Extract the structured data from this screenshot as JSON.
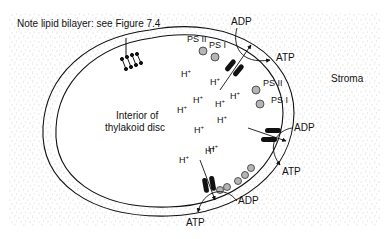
{
  "title_note": "Note lipid bilayer: see Figure 7.4",
  "labels": {
    "stroma": "Stroma",
    "interior_line1": "Interior of",
    "interior_line2": "thylakoid disc"
  },
  "photosystems": [
    {
      "label": "PS II",
      "x": 149,
      "y": 29
    },
    {
      "label": "PS I",
      "x": 173,
      "y": 37
    },
    {
      "label": "PS II",
      "x": 263,
      "y": 82
    },
    {
      "label": "PS I",
      "x": 269,
      "y": 99
    }
  ],
  "atp_synthases": [
    {
      "adp": "ADP",
      "atp": "ATP",
      "adp_x": 232,
      "adp_y": 18,
      "atp_x": 275,
      "atp_y": 55
    },
    {
      "adp": "ADP",
      "atp": "ATP",
      "adp_x": 292,
      "adp_y": 123,
      "atp_x": 282,
      "atp_y": 170
    },
    {
      "adp": "ADP",
      "atp": "ATP",
      "adp_x": 238,
      "adp_y": 198,
      "atp_x": 186,
      "atp_y": 219
    }
  ],
  "protons": [
    {
      "label": "H",
      "sup": "+",
      "x": 190,
      "y": 70
    },
    {
      "label": "H",
      "sup": "+",
      "x": 212,
      "y": 72
    },
    {
      "label": "H",
      "sup": "+",
      "x": 232,
      "y": 86
    },
    {
      "label": "H",
      "sup": "+",
      "x": 210,
      "y": 96
    },
    {
      "label": "H",
      "sup": "+",
      "x": 177,
      "y": 104
    },
    {
      "label": "H",
      "sup": "+",
      "x": 214,
      "y": 114
    },
    {
      "label": "H",
      "sup": "+",
      "x": 193,
      "y": 124
    },
    {
      "label": "H",
      "sup": "+",
      "x": 205,
      "y": 145
    },
    {
      "label": "H",
      "sup": "+",
      "x": 179,
      "y": 154
    },
    {
      "label": "H",
      "sup": "+",
      "x": 186,
      "y": 173
    },
    {
      "label": "H",
      "sup": "+",
      "x": 204,
      "y": 163
    }
  ],
  "colors": {
    "stroma_dots": "#9a9a9a",
    "line": "#111111",
    "photosystem_fill": "#b5b5b5"
  }
}
